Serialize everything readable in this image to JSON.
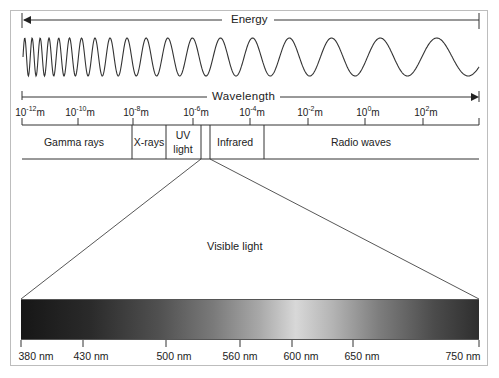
{
  "diagram": {
    "energy_label": "Energy",
    "wavelength_label": "Wavelength",
    "wavelength_ticks": [
      {
        "base": "10",
        "exp": "-12",
        "unit": "m"
      },
      {
        "base": "10",
        "exp": "-10",
        "unit": "m"
      },
      {
        "base": "10",
        "exp": "-8",
        "unit": "m"
      },
      {
        "base": "10",
        "exp": "-6",
        "unit": "m"
      },
      {
        "base": "10",
        "exp": "-4",
        "unit": "m"
      },
      {
        "base": "10",
        "exp": "-2",
        "unit": "m"
      },
      {
        "base": "10",
        "exp": "0",
        "unit": "m"
      },
      {
        "base": "10",
        "exp": "2",
        "unit": "m"
      }
    ],
    "regions": [
      {
        "name": "gamma",
        "label": "Gamma rays"
      },
      {
        "name": "xrays",
        "label": "X-rays"
      },
      {
        "name": "uv_line1",
        "label": "UV"
      },
      {
        "name": "uv_line2",
        "label": "light"
      },
      {
        "name": "infrared",
        "label": "Infrared"
      },
      {
        "name": "radio",
        "label": "Radio waves"
      }
    ],
    "visible_label": "Visible light",
    "visible_ticks": [
      "380 nm",
      "430 nm",
      "500 nm",
      "560 nm",
      "600 nm",
      "650 nm",
      "750 nm"
    ],
    "colors": {
      "line": "#333333",
      "frame": "#bdbdbd",
      "spectrum_dark": "#1a1a1a",
      "spectrum_light": "#d8d8d8"
    }
  }
}
